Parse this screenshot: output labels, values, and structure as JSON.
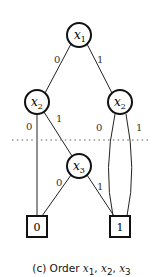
{
  "diagram": {
    "type": "binary-decision-diagram",
    "nodes": [
      {
        "id": "n1",
        "var": "x",
        "sub": "1",
        "kind": "decision"
      },
      {
        "id": "n2a",
        "var": "x",
        "sub": "2",
        "kind": "decision"
      },
      {
        "id": "n2b",
        "var": "x",
        "sub": "2",
        "kind": "decision"
      },
      {
        "id": "n3",
        "var": "x",
        "sub": "3",
        "kind": "decision"
      },
      {
        "id": "t0",
        "label": "0",
        "kind": "terminal"
      },
      {
        "id": "t1",
        "label": "1",
        "kind": "terminal"
      }
    ],
    "edges": [
      {
        "from": "n1",
        "to": "n2a",
        "label": "0"
      },
      {
        "from": "n1",
        "to": "n2b",
        "label": "1"
      },
      {
        "from": "n2a",
        "to": "t0",
        "label": "0"
      },
      {
        "from": "n2a",
        "to": "n3",
        "label": "1"
      },
      {
        "from": "n2b",
        "to": "t1",
        "label": "0"
      },
      {
        "from": "n2b",
        "to": "t1",
        "label": "1"
      },
      {
        "from": "n3",
        "to": "t0",
        "label": "0"
      },
      {
        "from": "n3",
        "to": "t1",
        "label": "1"
      }
    ],
    "separator": "dotted-line",
    "separator_color": "#999999"
  },
  "caption": {
    "prefix": "(c) Order ",
    "vars": [
      "x",
      "x",
      "x"
    ],
    "subs": [
      "1",
      "2",
      "3"
    ]
  }
}
